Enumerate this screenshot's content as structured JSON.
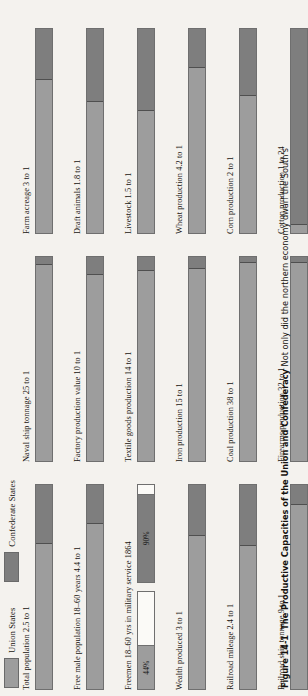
{
  "legend": {
    "entries": [
      {
        "label": "Union States",
        "color": "#9d9d9d",
        "icon": "legend-swatch"
      },
      {
        "label": "Confederate States",
        "color": "#7e7e7e",
        "icon": "legend-swatch"
      }
    ]
  },
  "caption": {
    "figure_number": "Figure 14-1",
    "title": "The Productive Capacities of the Union and Confederacy",
    "text": "Not only did the northern economy dwarf the South's"
  },
  "chart_data": {
    "type": "bar",
    "title": "The Productive Capacities of the Union and Confederacy",
    "legend": [
      "Union States",
      "Confederate States"
    ],
    "legend_position": "top-left",
    "xlabel": "",
    "ylabel": "",
    "note": "Each horizontal bar is a 100% stacked bar; Union share vs Confederate share of the stated ratio.",
    "columns": [
      {
        "bars": [
          {
            "label": "Total population 2.5 to 1",
            "ratio": "2.5 to 1",
            "union_pct": 71,
            "confederate_pct": 29,
            "union_label": "",
            "confederate_label": "",
            "style": "ratio"
          },
          {
            "label": "Free male population 18–60 years 4.4 to 1",
            "ratio": "4.4 to 1",
            "union_pct": 81,
            "confederate_pct": 19,
            "union_label": "",
            "confederate_label": "",
            "style": "ratio"
          },
          {
            "label": "Freemen 18–60 yrs in military service 1864",
            "ratio": "",
            "union_pct": 44,
            "confederate_pct": 90,
            "union_label": "44%",
            "confederate_label": "90%",
            "style": "percent-pair"
          },
          {
            "label": "Wealth produced 3 to 1",
            "ratio": "3 to 1",
            "union_pct": 75,
            "confederate_pct": 25,
            "union_label": "",
            "confederate_label": "",
            "style": "ratio"
          },
          {
            "label": "Railroad mileage 2.4 to 1",
            "ratio": "2.4 to 1",
            "union_pct": 70,
            "confederate_pct": 30,
            "union_label": "",
            "confederate_label": "",
            "style": "ratio"
          },
          {
            "label": "Railroad ship tonnage 9 to 1",
            "ratio": "9 to 1",
            "union_pct": 90,
            "confederate_pct": 10,
            "union_label": "",
            "confederate_label": "",
            "style": "ratio"
          }
        ]
      },
      {
        "bars": [
          {
            "label": "Naval ship tonnage 25 to 1",
            "ratio": "25 to 1",
            "union_pct": 96,
            "confederate_pct": 4,
            "union_label": "",
            "confederate_label": "",
            "style": "ratio"
          },
          {
            "label": "Factory production value 10 to 1",
            "ratio": "10 to 1",
            "union_pct": 91,
            "confederate_pct": 9,
            "union_label": "",
            "confederate_label": "",
            "style": "ratio"
          },
          {
            "label": "Textile goods production 14 to 1",
            "ratio": "14 to 1",
            "union_pct": 93,
            "confederate_pct": 7,
            "union_label": "",
            "confederate_label": "",
            "style": "ratio"
          },
          {
            "label": "Iron production 15 to 1",
            "ratio": "15 to 1",
            "union_pct": 94,
            "confederate_pct": 6,
            "union_label": "",
            "confederate_label": "",
            "style": "ratio"
          },
          {
            "label": "Coal production 38 to 1",
            "ratio": "38 to 1",
            "union_pct": 97,
            "confederate_pct": 3,
            "union_label": "",
            "confederate_label": "",
            "style": "ratio"
          },
          {
            "label": "Firearms production 32 to 1",
            "ratio": "32 to 1",
            "union_pct": 97,
            "confederate_pct": 3,
            "union_label": "",
            "confederate_label": "",
            "style": "ratio"
          }
        ]
      },
      {
        "bars": [
          {
            "label": "Farm acreage 3 to 1",
            "ratio": "3 to 1",
            "union_pct": 75,
            "confederate_pct": 25,
            "union_label": "",
            "confederate_label": "",
            "style": "ratio"
          },
          {
            "label": "Draft animals 1.8 to 1",
            "ratio": "1.8 to 1",
            "union_pct": 64,
            "confederate_pct": 36,
            "union_label": "",
            "confederate_label": "",
            "style": "ratio"
          },
          {
            "label": "Livestock 1.5 to 1",
            "ratio": "1.5 to 1",
            "union_pct": 60,
            "confederate_pct": 40,
            "union_label": "",
            "confederate_label": "",
            "style": "ratio"
          },
          {
            "label": "Wheat production 4.2 to 1",
            "ratio": "4.2 to 1",
            "union_pct": 81,
            "confederate_pct": 19,
            "union_label": "",
            "confederate_label": "",
            "style": "ratio"
          },
          {
            "label": "Corn production 2 to 1",
            "ratio": "2 to 1",
            "union_pct": 67,
            "confederate_pct": 33,
            "union_label": "",
            "confederate_label": "",
            "style": "ratio"
          },
          {
            "label": "Cotton production 1 to 24",
            "ratio": "1 to 24",
            "union_pct": 4,
            "confederate_pct": 96,
            "union_label": "",
            "confederate_label": "",
            "style": "ratio"
          }
        ]
      }
    ]
  }
}
